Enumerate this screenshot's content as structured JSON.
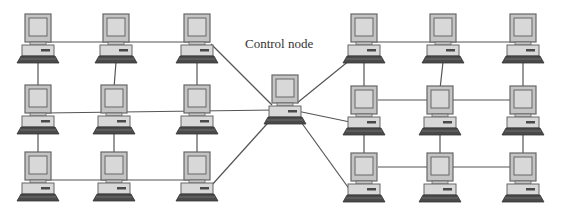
{
  "title": "Control node",
  "diagram": {
    "control_label": "Control node",
    "line_color": "#555555",
    "node_colors": {
      "frame": "#666666",
      "screen": "#d8d8d8",
      "bezel": "#c4c4c4",
      "keyboard": "#4a4a4a"
    },
    "nodes": [
      {
        "id": "L00",
        "group": "left",
        "row": 0,
        "col": 0,
        "x": 38,
        "y": 14
      },
      {
        "id": "L01",
        "group": "left",
        "row": 0,
        "col": 1,
        "x": 116,
        "y": 14
      },
      {
        "id": "L02",
        "group": "left",
        "row": 0,
        "col": 2,
        "x": 197,
        "y": 14
      },
      {
        "id": "L10",
        "group": "left",
        "row": 1,
        "col": 0,
        "x": 38,
        "y": 85
      },
      {
        "id": "L11",
        "group": "left",
        "row": 1,
        "col": 1,
        "x": 114,
        "y": 85
      },
      {
        "id": "L12",
        "group": "left",
        "row": 1,
        "col": 2,
        "x": 197,
        "y": 85
      },
      {
        "id": "L20",
        "group": "left",
        "row": 2,
        "col": 0,
        "x": 38,
        "y": 152
      },
      {
        "id": "L21",
        "group": "left",
        "row": 2,
        "col": 1,
        "x": 114,
        "y": 152
      },
      {
        "id": "L22",
        "group": "left",
        "row": 2,
        "col": 2,
        "x": 197,
        "y": 152
      },
      {
        "id": "C",
        "group": "control",
        "row": 0,
        "col": 0,
        "x": 285,
        "y": 75
      },
      {
        "id": "R00",
        "group": "right",
        "row": 0,
        "col": 0,
        "x": 364,
        "y": 14
      },
      {
        "id": "R01",
        "group": "right",
        "row": 0,
        "col": 1,
        "x": 443,
        "y": 14
      },
      {
        "id": "R02",
        "group": "right",
        "row": 0,
        "col": 2,
        "x": 523,
        "y": 14
      },
      {
        "id": "R10",
        "group": "right",
        "row": 1,
        "col": 0,
        "x": 364,
        "y": 86
      },
      {
        "id": "R11",
        "group": "right",
        "row": 1,
        "col": 1,
        "x": 440,
        "y": 86
      },
      {
        "id": "R12",
        "group": "right",
        "row": 1,
        "col": 2,
        "x": 523,
        "y": 86
      },
      {
        "id": "R20",
        "group": "right",
        "row": 2,
        "col": 0,
        "x": 364,
        "y": 153
      },
      {
        "id": "R21",
        "group": "right",
        "row": 2,
        "col": 1,
        "x": 440,
        "y": 153
      },
      {
        "id": "R22",
        "group": "right",
        "row": 2,
        "col": 2,
        "x": 523,
        "y": 153
      }
    ],
    "edges": [
      {
        "from": [
          45,
          42
        ],
        "to": [
          210,
          42
        ]
      },
      {
        "from": [
          38,
          62
        ],
        "to": [
          38,
          88
        ]
      },
      {
        "from": [
          116,
          62
        ],
        "to": [
          114,
          88
        ]
      },
      {
        "from": [
          197,
          62
        ],
        "to": [
          197,
          88
        ]
      },
      {
        "from": [
          45,
          113
        ],
        "to": [
          275,
          110
        ]
      },
      {
        "from": [
          38,
          133
        ],
        "to": [
          38,
          155
        ]
      },
      {
        "from": [
          114,
          133
        ],
        "to": [
          114,
          155
        ]
      },
      {
        "from": [
          197,
          133
        ],
        "to": [
          197,
          155
        ]
      },
      {
        "from": [
          45,
          180
        ],
        "to": [
          200,
          180
        ]
      },
      {
        "from": [
          211,
          44
        ],
        "to": [
          272,
          105
        ]
      },
      {
        "from": [
          211,
          186
        ],
        "to": [
          275,
          115
        ]
      },
      {
        "from": [
          297,
          103
        ],
        "to": [
          350,
          60
        ]
      },
      {
        "from": [
          297,
          111
        ],
        "to": [
          350,
          122
        ]
      },
      {
        "from": [
          296,
          115
        ],
        "to": [
          350,
          190
        ]
      },
      {
        "from": [
          370,
          42
        ],
        "to": [
          523,
          42
        ]
      },
      {
        "from": [
          364,
          62
        ],
        "to": [
          364,
          89
        ]
      },
      {
        "from": [
          443,
          62
        ],
        "to": [
          440,
          89
        ]
      },
      {
        "from": [
          523,
          62
        ],
        "to": [
          523,
          89
        ]
      },
      {
        "from": [
          378,
          100
        ],
        "to": [
          510,
          100
        ]
      },
      {
        "from": [
          364,
          133
        ],
        "to": [
          364,
          156
        ]
      },
      {
        "from": [
          440,
          133
        ],
        "to": [
          440,
          156
        ]
      },
      {
        "from": [
          523,
          133
        ],
        "to": [
          523,
          156
        ]
      },
      {
        "from": [
          378,
          167
        ],
        "to": [
          510,
          167
        ]
      }
    ]
  }
}
